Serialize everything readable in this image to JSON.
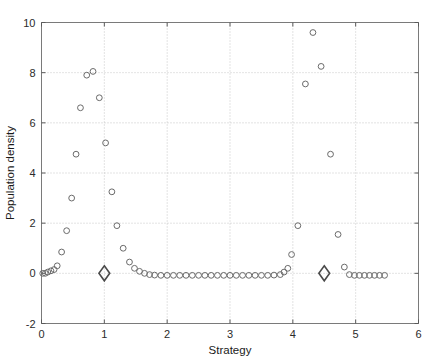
{
  "chart_data": {
    "type": "scatter",
    "title": "",
    "xlabel": "Strategy",
    "ylabel": "Population density",
    "xlim": [
      0,
      6
    ],
    "ylim": [
      -2,
      10
    ],
    "xticks": [
      0,
      1,
      2,
      3,
      4,
      5,
      6
    ],
    "yticks": [
      -2,
      0,
      2,
      4,
      6,
      8,
      10
    ],
    "xticklabels": [
      "0",
      "1",
      "2",
      "3",
      "4",
      "5",
      "6"
    ],
    "yticklabels": [
      "-2",
      "0",
      "2",
      "4",
      "6",
      "8",
      "10"
    ],
    "grid": true,
    "legend": null,
    "series": [
      {
        "name": "population-density-points",
        "marker": "circle",
        "color": "#6b6b6b",
        "points": [
          [
            0.02,
            0.0
          ],
          [
            0.06,
            0.0
          ],
          [
            0.1,
            0.05
          ],
          [
            0.15,
            0.1
          ],
          [
            0.2,
            0.15
          ],
          [
            0.25,
            0.3
          ],
          [
            0.32,
            0.85
          ],
          [
            0.4,
            1.7
          ],
          [
            0.48,
            3.0
          ],
          [
            0.55,
            4.75
          ],
          [
            0.62,
            6.6
          ],
          [
            0.72,
            7.9
          ],
          [
            0.82,
            8.05
          ],
          [
            0.92,
            7.0
          ],
          [
            1.02,
            5.2
          ],
          [
            1.12,
            3.25
          ],
          [
            1.2,
            1.9
          ],
          [
            1.3,
            1.0
          ],
          [
            1.4,
            0.45
          ],
          [
            1.48,
            0.2
          ],
          [
            1.56,
            0.08
          ],
          [
            1.64,
            0.0
          ],
          [
            1.72,
            -0.05
          ],
          [
            1.8,
            -0.07
          ],
          [
            1.9,
            -0.08
          ],
          [
            2.0,
            -0.08
          ],
          [
            2.1,
            -0.08
          ],
          [
            2.2,
            -0.08
          ],
          [
            2.3,
            -0.08
          ],
          [
            2.4,
            -0.08
          ],
          [
            2.5,
            -0.08
          ],
          [
            2.6,
            -0.08
          ],
          [
            2.7,
            -0.08
          ],
          [
            2.8,
            -0.08
          ],
          [
            2.9,
            -0.08
          ],
          [
            3.0,
            -0.08
          ],
          [
            3.1,
            -0.08
          ],
          [
            3.2,
            -0.08
          ],
          [
            3.3,
            -0.08
          ],
          [
            3.4,
            -0.08
          ],
          [
            3.5,
            -0.08
          ],
          [
            3.6,
            -0.08
          ],
          [
            3.7,
            -0.07
          ],
          [
            3.8,
            -0.05
          ],
          [
            3.86,
            0.05
          ],
          [
            3.92,
            0.2
          ],
          [
            3.98,
            0.75
          ],
          [
            4.08,
            1.9
          ],
          [
            4.2,
            7.55
          ],
          [
            4.32,
            9.6
          ],
          [
            4.45,
            8.25
          ],
          [
            4.6,
            4.75
          ],
          [
            4.72,
            1.55
          ],
          [
            4.82,
            0.25
          ],
          [
            4.9,
            -0.05
          ],
          [
            4.98,
            -0.08
          ],
          [
            5.06,
            -0.08
          ],
          [
            5.14,
            -0.08
          ],
          [
            5.22,
            -0.08
          ],
          [
            5.3,
            -0.08
          ],
          [
            5.38,
            -0.08
          ],
          [
            5.46,
            -0.08
          ]
        ]
      },
      {
        "name": "equilibria-markers",
        "marker": "diamond",
        "color": "#4a4a4a",
        "points": [
          [
            1.0,
            0.0
          ],
          [
            4.5,
            0.0
          ]
        ]
      }
    ]
  }
}
